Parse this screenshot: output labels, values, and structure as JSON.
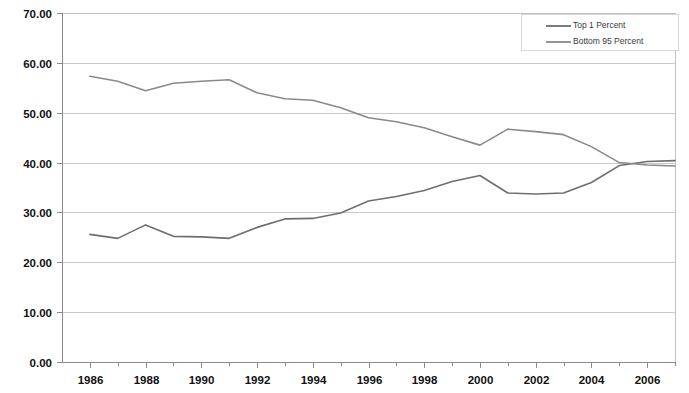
{
  "chart_data": {
    "type": "line",
    "title": "",
    "subtitle": "",
    "xlabel": "",
    "ylabel": "",
    "xlim": [
      1985,
      2007
    ],
    "ylim": [
      0.0,
      70.0
    ],
    "grid": true,
    "legend_position": "top-right",
    "x": [
      1986,
      1987,
      1988,
      1989,
      1990,
      1991,
      1992,
      1993,
      1994,
      1995,
      1996,
      1997,
      1998,
      1999,
      2000,
      2001,
      2002,
      2003,
      2004,
      2005,
      2006,
      2007
    ],
    "y_ticks": [
      0.0,
      10.0,
      20.0,
      30.0,
      40.0,
      50.0,
      60.0,
      70.0
    ],
    "y_tick_labels": [
      "0.00",
      "10.00",
      "20.00",
      "30.00",
      "40.00",
      "50.00",
      "60.00",
      "70.00"
    ],
    "x_ticks": [
      1986,
      1987,
      1988,
      1989,
      1990,
      1991,
      1992,
      1993,
      1994,
      1995,
      1996,
      1997,
      1998,
      1999,
      2000,
      2001,
      2002,
      2003,
      2004,
      2005,
      2006,
      2007
    ],
    "x_tick_labels": [
      "1986",
      "",
      "1988",
      "",
      "1990",
      "",
      "1992",
      "",
      "1994",
      "",
      "1996",
      "",
      "1998",
      "",
      "2000",
      "",
      "2002",
      "",
      "2004",
      "",
      "2006",
      ""
    ],
    "series": [
      {
        "name": "Top 1 Percent",
        "color": "#6e6e6e",
        "values": [
          25.6,
          24.8,
          27.5,
          25.2,
          25.1,
          24.8,
          27.0,
          28.7,
          28.8,
          29.9,
          32.3,
          33.2,
          34.4,
          36.2,
          37.4,
          33.9,
          33.7,
          33.9,
          36.0,
          39.4,
          40.2,
          40.4
        ]
      },
      {
        "name": "Bottom 95 Percent",
        "color": "#8a8a8a",
        "values": [
          57.3,
          56.3,
          54.4,
          55.9,
          56.3,
          56.6,
          54.0,
          52.8,
          52.5,
          51.0,
          49.0,
          48.2,
          47.0,
          45.2,
          43.5,
          46.7,
          46.2,
          45.6,
          43.2,
          40.0,
          39.5,
          39.3
        ]
      }
    ]
  },
  "legend": {
    "entries": [
      {
        "label": "Top 1 Percent"
      },
      {
        "label": "Bottom 95 Percent"
      }
    ]
  }
}
